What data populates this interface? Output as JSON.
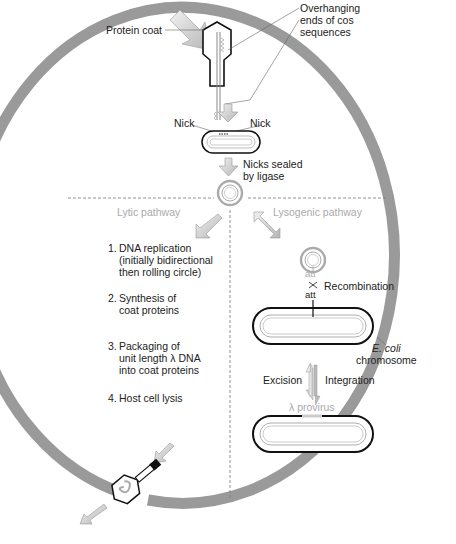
{
  "figure": {
    "colors": {
      "cell_wall": "#9a9a9a",
      "arrow_fill": "#c8c8c8",
      "outline": "#111111",
      "grey_text": "#aaaaaa",
      "text": "#222222"
    }
  },
  "labels": {
    "protein_coat": "Protein coat",
    "overhanging_line1": "Overhanging",
    "overhanging_line2": "ends of cos",
    "overhanging_line3": "sequences",
    "nick_left": "Nick",
    "nick_right": "Nick",
    "nicks_sealed_line1": "Nicks sealed",
    "nicks_sealed_line2": "by ligase",
    "lytic_pathway": "Lytic pathway",
    "lysogenic_pathway": "Lysogenic pathway",
    "att_phage": "att",
    "att_bacterial": "att",
    "recombination": "Recombination",
    "ecoli": "E. coli",
    "chromosome": "chromosome",
    "excision": "Excision",
    "integration": "Integration",
    "provirus": "λ provirus"
  },
  "lytic_steps": [
    {
      "num": "1.",
      "lines": [
        "DNA replication",
        "(initially bidirectional",
        "then rolling circle)"
      ]
    },
    {
      "num": "2.",
      "lines": [
        "Synthesis of",
        "coat proteins"
      ]
    },
    {
      "num": "3.",
      "lines": [
        "Packaging of",
        "unit length λ DNA",
        "into coat proteins"
      ]
    },
    {
      "num": "4.",
      "lines": [
        "Host cell lysis"
      ]
    }
  ]
}
